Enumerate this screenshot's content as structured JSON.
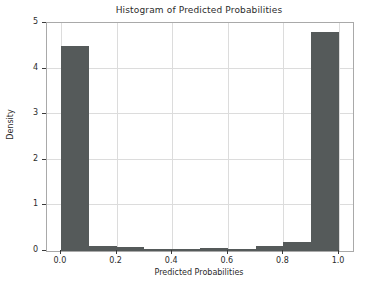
{
  "chart_data": {
    "type": "bar",
    "title": "Histogram of Predicted Probabilities",
    "xlabel": "Predicted Probabilities",
    "ylabel": "Density",
    "xlim": [
      -0.05,
      1.05
    ],
    "ylim": [
      0,
      5
    ],
    "grid": true,
    "legend": null,
    "bin_width": 0.1,
    "bin_edges": [
      0.0,
      0.1,
      0.2,
      0.3,
      0.4,
      0.5,
      0.6,
      0.7,
      0.8,
      0.9,
      1.0
    ],
    "categories": [
      "0.0-0.1",
      "0.1-0.2",
      "0.2-0.3",
      "0.3-0.4",
      "0.4-0.5",
      "0.5-0.6",
      "0.6-0.7",
      "0.7-0.8",
      "0.8-0.9",
      "0.9-1.0"
    ],
    "values": [
      4.5,
      0.12,
      0.08,
      0.04,
      0.04,
      0.06,
      0.05,
      0.12,
      0.19,
      4.8
    ],
    "bar_color": "#555a5a",
    "xticks": [
      0.0,
      0.2,
      0.4,
      0.6,
      0.8,
      1.0
    ],
    "xtick_labels": [
      "0.0",
      "0.2",
      "0.4",
      "0.6",
      "0.8",
      "1.0"
    ],
    "yticks": [
      0,
      1,
      2,
      3,
      4,
      5
    ],
    "ytick_labels": [
      "0",
      "1",
      "2",
      "3",
      "4",
      "5"
    ],
    "grid_color": "#dcdcdc",
    "axes_color": "#a9a9a9",
    "background_color": "#ffffff"
  }
}
